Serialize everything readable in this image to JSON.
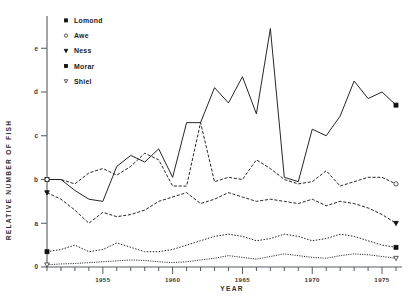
{
  "chart_data": {
    "type": "line",
    "title": "",
    "xlabel": "YEAR",
    "ylabel": "RELATIVE NUMBER OF FISH",
    "grid": false,
    "legend_position": "top-left",
    "xlim": [
      1951,
      1976
    ],
    "ylim": [
      0,
      5.6
    ],
    "x_tick_labels": [
      "1955",
      "1960",
      "1965",
      "1970",
      "1975"
    ],
    "x_tick_values": [
      1955,
      1960,
      1965,
      1970,
      1975
    ],
    "x_minor_tick_interval": 1,
    "y_tick_labels": [
      "0",
      "a",
      "b",
      "c",
      "d",
      "e"
    ],
    "y_tick_values": [
      0,
      1,
      2,
      3,
      4,
      5
    ],
    "x": [
      1951,
      1952,
      1953,
      1954,
      1955,
      1956,
      1957,
      1958,
      1959,
      1960,
      1961,
      1962,
      1963,
      1964,
      1965,
      1966,
      1967,
      1968,
      1969,
      1970,
      1971,
      1972,
      1973,
      1974,
      1975,
      1976
    ],
    "series": [
      {
        "name": "Lomond",
        "marker": "filled-square",
        "line_style": "solid",
        "values": [
          2.0,
          2.0,
          1.75,
          1.55,
          1.5,
          2.3,
          2.55,
          2.4,
          2.7,
          2.05,
          3.3,
          3.3,
          4.1,
          3.75,
          4.35,
          3.5,
          5.45,
          2.05,
          1.95,
          3.15,
          3.0,
          3.45,
          4.25,
          3.85,
          4.0,
          3.7
        ]
      },
      {
        "name": "Awe",
        "marker": "open-circle",
        "line_style": "dashed",
        "values": [
          2.0,
          2.0,
          1.9,
          2.15,
          2.25,
          2.1,
          2.3,
          2.6,
          2.45,
          1.85,
          1.85,
          3.3,
          1.95,
          2.05,
          2.0,
          2.45,
          2.25,
          2.0,
          1.9,
          1.95,
          2.2,
          1.85,
          1.95,
          2.05,
          2.05,
          1.9
        ]
      },
      {
        "name": "Ness",
        "marker": "filled-triangle-down",
        "line_style": "dashed",
        "values": [
          1.7,
          1.55,
          1.3,
          1.0,
          1.25,
          1.15,
          1.2,
          1.3,
          1.5,
          1.6,
          1.7,
          1.45,
          1.55,
          1.7,
          1.6,
          1.5,
          1.55,
          1.5,
          1.45,
          1.55,
          1.4,
          1.5,
          1.45,
          1.35,
          1.2,
          1.0
        ]
      },
      {
        "name": "Morar",
        "marker": "filled-square",
        "line_style": "dotted",
        "values": [
          0.35,
          0.4,
          0.5,
          0.35,
          0.4,
          0.55,
          0.45,
          0.35,
          0.35,
          0.4,
          0.5,
          0.6,
          0.7,
          0.75,
          0.7,
          0.6,
          0.65,
          0.75,
          0.7,
          0.6,
          0.65,
          0.75,
          0.7,
          0.6,
          0.5,
          0.45
        ]
      },
      {
        "name": "Shiel",
        "marker": "open-triangle-down",
        "line_style": "dotted-fine",
        "values": [
          0.05,
          0.07,
          0.08,
          0.1,
          0.12,
          0.14,
          0.16,
          0.15,
          0.12,
          0.1,
          0.12,
          0.16,
          0.2,
          0.26,
          0.22,
          0.18,
          0.24,
          0.3,
          0.26,
          0.22,
          0.2,
          0.26,
          0.3,
          0.28,
          0.24,
          0.2
        ]
      }
    ]
  },
  "legend": {
    "items": [
      {
        "label": "Lomond",
        "marker": "filled-square"
      },
      {
        "label": "Awe",
        "marker": "open-circle"
      },
      {
        "label": "Ness",
        "marker": "filled-triangle-down"
      },
      {
        "label": "Morar",
        "marker": "filled-square"
      },
      {
        "label": "Shiel",
        "marker": "open-triangle-down"
      }
    ]
  },
  "axes": {
    "x_title": "YEAR",
    "y_title": "RELATIVE NUMBER OF FISH"
  }
}
